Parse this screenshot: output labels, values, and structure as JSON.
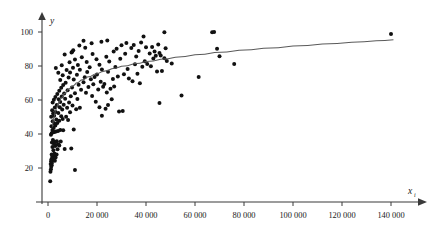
{
  "chart_data": {
    "type": "scatter",
    "title": "",
    "subtitle": "",
    "xlabel": "x",
    "xlabel_subscript": "i",
    "ylabel": "y",
    "grid": false,
    "legend": "none",
    "xlim": [
      -4000,
      152000
    ],
    "ylim": [
      8,
      106
    ],
    "x_ticks": [
      0,
      20000,
      40000,
      60000,
      80000,
      100000,
      120000,
      140000
    ],
    "x_tick_labels": [
      "0",
      "20 000",
      "40 000",
      "60 000",
      "80 000",
      "100 000",
      "120 000",
      "140 000"
    ],
    "y_ticks": [
      20,
      40,
      60,
      80,
      100
    ],
    "y_tick_labels": [
      "20",
      "40",
      "60",
      "80",
      "100"
    ],
    "point_color": "#111111",
    "curve_color": "#5a5a5a",
    "axis_color": "#3a3a3a",
    "marker_radius": 2.0,
    "annotations": [],
    "fit_curve": {
      "type": "logarithmic",
      "description": "smooth increasing concave curve through scatter",
      "points": [
        [
          1600,
          44.0
        ],
        [
          2200,
          49.5
        ],
        [
          3000,
          54.0
        ],
        [
          4000,
          57.8
        ],
        [
          5200,
          61.0
        ],
        [
          6500,
          63.6
        ],
        [
          8000,
          66.0
        ],
        [
          9500,
          67.9
        ],
        [
          11500,
          70.0
        ],
        [
          13500,
          71.7
        ],
        [
          16000,
          73.5
        ],
        [
          19000,
          75.2
        ],
        [
          22000,
          76.7
        ],
        [
          26000,
          78.4
        ],
        [
          30000,
          79.8
        ],
        [
          35000,
          81.3
        ],
        [
          40000,
          82.6
        ],
        [
          46000,
          84.0
        ],
        [
          52000,
          85.2
        ],
        [
          60000,
          86.6
        ],
        [
          68000,
          87.9
        ],
        [
          78000,
          89.3
        ],
        [
          88000,
          90.5
        ],
        [
          100000,
          91.8
        ],
        [
          112000,
          93.0
        ],
        [
          124000,
          94.0
        ],
        [
          134000,
          94.8
        ],
        [
          141000,
          95.4
        ]
      ]
    },
    "points": [
      [
        900,
        12.2
      ],
      [
        1000,
        17.8
      ],
      [
        1200,
        19.2
      ],
      [
        1300,
        20.8
      ],
      [
        1500,
        21.6
      ],
      [
        1100,
        22.4
      ],
      [
        1600,
        23.0
      ],
      [
        1250,
        24.0
      ],
      [
        1900,
        24.6
      ],
      [
        1400,
        25.2
      ],
      [
        2100,
        25.8
      ],
      [
        1700,
        26.4
      ],
      [
        2400,
        27.0
      ],
      [
        1500,
        28.0
      ],
      [
        2800,
        24.3
      ],
      [
        3100,
        26.2
      ],
      [
        2600,
        28.6
      ],
      [
        3500,
        28.0
      ],
      [
        2200,
        30.5
      ],
      [
        3900,
        31.0
      ],
      [
        1800,
        32.4
      ],
      [
        2900,
        33.0
      ],
      [
        3300,
        33.6
      ],
      [
        2400,
        34.2
      ],
      [
        4200,
        34.0
      ],
      [
        1600,
        35.0
      ],
      [
        2700,
        35.4
      ],
      [
        3600,
        35.8
      ],
      [
        2000,
        36.4
      ],
      [
        4600,
        33.2
      ],
      [
        5200,
        35.6
      ],
      [
        6800,
        31.2
      ],
      [
        9500,
        31.5
      ],
      [
        11000,
        18.8
      ],
      [
        1200,
        39.5
      ],
      [
        1500,
        40.4
      ],
      [
        2000,
        41.0
      ],
      [
        2600,
        41.2
      ],
      [
        3300,
        41.5
      ],
      [
        4100,
        41.8
      ],
      [
        1800,
        42.3
      ],
      [
        5000,
        42.4
      ],
      [
        6200,
        42.2
      ],
      [
        10500,
        42.6
      ],
      [
        2300,
        43.5
      ],
      [
        1400,
        44.5
      ],
      [
        3000,
        45.0
      ],
      [
        2700,
        46.0
      ],
      [
        3800,
        46.5
      ],
      [
        1900,
        47.5
      ],
      [
        4600,
        47.8
      ],
      [
        3400,
        48.5
      ],
      [
        6000,
        48.8
      ],
      [
        8200,
        48.2
      ],
      [
        1300,
        50.2
      ],
      [
        2500,
        50.8
      ],
      [
        5400,
        50.5
      ],
      [
        7400,
        50.2
      ],
      [
        22000,
        50.8
      ],
      [
        2100,
        52.0
      ],
      [
        4200,
        52.3
      ],
      [
        3100,
        53.0
      ],
      [
        9000,
        52.8
      ],
      [
        29000,
        53.2
      ],
      [
        30500,
        53.6
      ],
      [
        1700,
        54.0
      ],
      [
        5800,
        54.4
      ],
      [
        11500,
        54.6
      ],
      [
        23500,
        54.8
      ],
      [
        2800,
        55.6
      ],
      [
        4800,
        55.8
      ],
      [
        7800,
        55.5
      ],
      [
        13000,
        55.4
      ],
      [
        21000,
        55.8
      ],
      [
        3600,
        57.0
      ],
      [
        6400,
        57.2
      ],
      [
        10000,
        56.8
      ],
      [
        24500,
        57.0
      ],
      [
        45500,
        58.2
      ],
      [
        1900,
        58.6
      ],
      [
        5000,
        58.8
      ],
      [
        8600,
        58.6
      ],
      [
        19500,
        59.0
      ],
      [
        2400,
        60.2
      ],
      [
        4400,
        60.5
      ],
      [
        7000,
        60.8
      ],
      [
        12000,
        60.6
      ],
      [
        26000,
        60.4
      ],
      [
        3000,
        61.8
      ],
      [
        5600,
        62.0
      ],
      [
        9300,
        62.2
      ],
      [
        18000,
        62.4
      ],
      [
        54500,
        62.6
      ],
      [
        3800,
        63.5
      ],
      [
        6600,
        63.8
      ],
      [
        11000,
        64.0
      ],
      [
        15500,
        64.2
      ],
      [
        24000,
        64.4
      ],
      [
        4600,
        65.5
      ],
      [
        8000,
        65.8
      ],
      [
        13500,
        66.0
      ],
      [
        20500,
        66.2
      ],
      [
        25500,
        66.6
      ],
      [
        5400,
        67.2
      ],
      [
        9800,
        67.4
      ],
      [
        16500,
        67.6
      ],
      [
        22500,
        67.8
      ],
      [
        27000,
        68.0
      ],
      [
        6200,
        68.8
      ],
      [
        12500,
        69.0
      ],
      [
        18500,
        69.2
      ],
      [
        23000,
        69.4
      ],
      [
        37500,
        69.8
      ],
      [
        7200,
        70.2
      ],
      [
        14500,
        70.4
      ],
      [
        21500,
        70.8
      ],
      [
        34500,
        71.0
      ],
      [
        5000,
        71.8
      ],
      [
        10500,
        72.0
      ],
      [
        17500,
        72.2
      ],
      [
        26500,
        72.4
      ],
      [
        33000,
        72.6
      ],
      [
        8400,
        73.2
      ],
      [
        15000,
        73.4
      ],
      [
        19000,
        73.6
      ],
      [
        28500,
        73.8
      ],
      [
        61500,
        73.6
      ],
      [
        6000,
        74.6
      ],
      [
        11800,
        74.8
      ],
      [
        20000,
        75.0
      ],
      [
        31000,
        75.2
      ],
      [
        36500,
        75.4
      ],
      [
        4200,
        76.0
      ],
      [
        9000,
        76.2
      ],
      [
        16000,
        76.4
      ],
      [
        24500,
        76.6
      ],
      [
        44500,
        76.8
      ],
      [
        46500,
        77.0
      ],
      [
        7600,
        77.6
      ],
      [
        13000,
        77.8
      ],
      [
        22000,
        78.0
      ],
      [
        32500,
        78.2
      ],
      [
        3200,
        78.8
      ],
      [
        10200,
        79.0
      ],
      [
        17000,
        79.2
      ],
      [
        27500,
        79.4
      ],
      [
        38500,
        79.6
      ],
      [
        42000,
        79.8
      ],
      [
        5600,
        80.4
      ],
      [
        12200,
        80.6
      ],
      [
        21000,
        80.8
      ],
      [
        35500,
        81.0
      ],
      [
        40500,
        81.2
      ],
      [
        50500,
        81.4
      ],
      [
        76000,
        81.2
      ],
      [
        8800,
        82.2
      ],
      [
        15800,
        82.4
      ],
      [
        25000,
        82.6
      ],
      [
        39500,
        82.8
      ],
      [
        48500,
        83.0
      ],
      [
        11000,
        83.8
      ],
      [
        19800,
        84.0
      ],
      [
        29500,
        84.2
      ],
      [
        43000,
        84.4
      ],
      [
        47500,
        84.6
      ],
      [
        70000,
        85.8
      ],
      [
        13800,
        85.2
      ],
      [
        23800,
        85.4
      ],
      [
        36000,
        85.6
      ],
      [
        44000,
        86.0
      ],
      [
        46000,
        86.2
      ],
      [
        6800,
        86.8
      ],
      [
        18200,
        87.0
      ],
      [
        31500,
        87.2
      ],
      [
        41500,
        87.4
      ],
      [
        45500,
        87.6
      ],
      [
        9600,
        88.0
      ],
      [
        9900,
        88.4
      ],
      [
        26800,
        88.6
      ],
      [
        37000,
        88.8
      ],
      [
        43500,
        88.6
      ],
      [
        10300,
        89.2
      ],
      [
        69000,
        90.2
      ],
      [
        48000,
        90.4
      ],
      [
        34000,
        90.6
      ],
      [
        15200,
        90.8
      ],
      [
        28000,
        90.2
      ],
      [
        40000,
        91.0
      ],
      [
        42500,
        91.2
      ],
      [
        12800,
        92.0
      ],
      [
        30000,
        92.2
      ],
      [
        35000,
        92.4
      ],
      [
        45000,
        92.6
      ],
      [
        17800,
        93.4
      ],
      [
        32000,
        93.6
      ],
      [
        38000,
        93.8
      ],
      [
        21800,
        94.2
      ],
      [
        14500,
        94.8
      ],
      [
        24200,
        95.0
      ],
      [
        39000,
        97.4
      ],
      [
        47500,
        99.8
      ],
      [
        67000,
        99.8
      ],
      [
        67800,
        100.0
      ],
      [
        140000,
        98.8
      ]
    ]
  }
}
